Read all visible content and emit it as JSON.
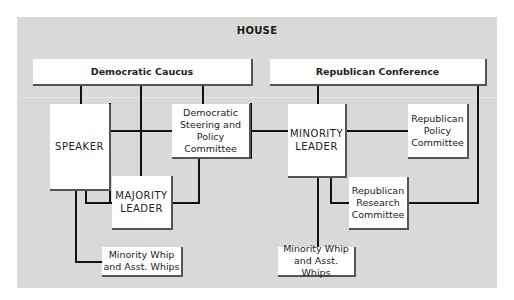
{
  "title": "HOUSE",
  "colors": {
    "panel_background": "#d9d9d7",
    "box_background": "#ffffff",
    "line": "#111111",
    "box_shadow_edge": "#555555"
  },
  "nodes": {
    "democratic_caucus": {
      "label": "Democratic Caucus"
    },
    "republican_conference": {
      "label": "Republican Conference"
    },
    "speaker": {
      "label": "SPEAKER"
    },
    "democratic_steering": {
      "label": "Democratic\nSteering and\nPolicy\nCommittee"
    },
    "majority_leader": {
      "label": "MAJORITY\nLEADER"
    },
    "majority_side_whip": {
      "label": "Minority Whip\nand Asst. Whips"
    },
    "minority_leader": {
      "label": "MINORITY\nLEADER"
    },
    "republican_policy": {
      "label": "Republican\nPolicy\nCommittee"
    },
    "republican_research": {
      "label": "Republican\nResearch\nCommittee"
    },
    "minority_side_whip": {
      "label": "Minority Whip\nand Asst. Whips"
    }
  },
  "edges": [
    [
      "democratic_caucus",
      "speaker"
    ],
    [
      "democratic_caucus",
      "majority_leader"
    ],
    [
      "democratic_caucus",
      "democratic_steering"
    ],
    [
      "speaker",
      "democratic_steering"
    ],
    [
      "speaker",
      "majority_leader"
    ],
    [
      "speaker",
      "majority_side_whip"
    ],
    [
      "democratic_steering",
      "majority_leader"
    ],
    [
      "democratic_steering",
      "minority_leader"
    ],
    [
      "republican_conference",
      "minority_leader"
    ],
    [
      "republican_conference",
      "republican_research"
    ],
    [
      "minority_leader",
      "republican_policy"
    ],
    [
      "minority_leader",
      "republican_research"
    ],
    [
      "minority_leader",
      "minority_side_whip"
    ]
  ]
}
